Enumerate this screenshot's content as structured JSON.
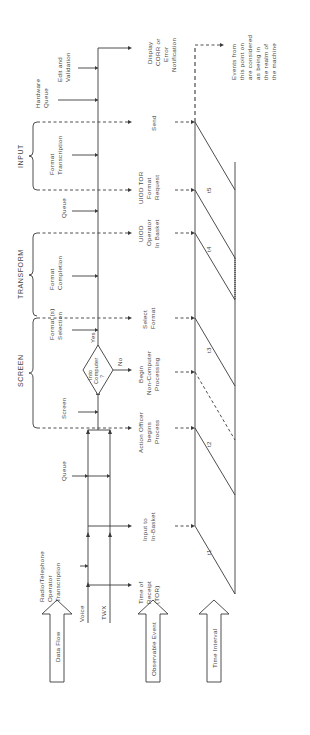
{
  "sections": {
    "screen": "SCREEN",
    "transform": "TRANSFORM",
    "input": "INPUT"
  },
  "row_labels": {
    "data_flow": "Data Flow",
    "observable_event": "Observable Event",
    "time_interval": "Time Interval"
  },
  "inputs": {
    "voice": "Voice",
    "twx": "TWX"
  },
  "data_flow_steps": [
    {
      "id": "radio",
      "lines": [
        "Radio/Telephone",
        "Operator",
        "Transcription"
      ]
    },
    {
      "id": "queue1",
      "lines": [
        "Queue"
      ]
    },
    {
      "id": "screen",
      "lines": [
        "Screen"
      ]
    },
    {
      "id": "format_selection",
      "lines": [
        "Format (s)",
        "Selection"
      ]
    },
    {
      "id": "format_completion",
      "lines": [
        "Format",
        "Completion"
      ]
    },
    {
      "id": "queue2",
      "lines": [
        "Queue"
      ]
    },
    {
      "id": "format_transcription",
      "lines": [
        "Format",
        "Transcription"
      ]
    },
    {
      "id": "hardware_queue",
      "lines": [
        "Hardware",
        "Queue"
      ]
    },
    {
      "id": "edit_validation",
      "lines": [
        "Edit and",
        "Validation"
      ]
    }
  ],
  "decision": {
    "lines": [
      "Into",
      "Computer",
      "?"
    ],
    "yes": "Yes",
    "no": "No"
  },
  "observable_events": [
    {
      "id": "tor",
      "lines": [
        "Time of",
        "Receipt",
        "(TOR)"
      ]
    },
    {
      "id": "in_basket",
      "lines": [
        "Input to",
        "In-Basket"
      ]
    },
    {
      "id": "action_officer",
      "lines": [
        "Action Officer",
        "begins",
        "Process"
      ]
    },
    {
      "id": "non_computer",
      "lines": [
        "Begin",
        "Non-Computer",
        "Processing"
      ]
    },
    {
      "id": "select_format",
      "lines": [
        "Select",
        "Format"
      ]
    },
    {
      "id": "uiod_operator",
      "lines": [
        "UIOD",
        "Operator",
        "In Basket"
      ]
    },
    {
      "id": "uiod_tor",
      "lines": [
        "UIOD TOR",
        "Format",
        "Request"
      ]
    },
    {
      "id": "send",
      "lines": [
        "Send"
      ]
    },
    {
      "id": "display",
      "lines": [
        "Display",
        "CORR or",
        "Error",
        "Notification"
      ]
    }
  ],
  "time_intervals": [
    "t1",
    "t2",
    "t3",
    "t4",
    "t5"
  ],
  "note": {
    "lines": [
      "Events from",
      "this point on",
      "are considered",
      "as being in",
      "the realm of",
      "the machine"
    ]
  }
}
